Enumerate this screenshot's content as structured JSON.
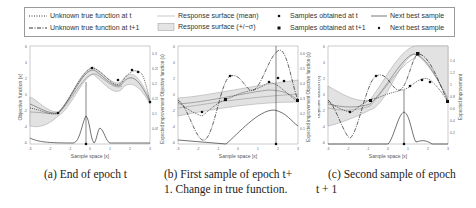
{
  "legend": {
    "items": [
      {
        "label": "Unknown true function at t",
        "icon": "dotted-line"
      },
      {
        "label": "Unknown true function at t+1",
        "icon": "dash-dot-line"
      },
      {
        "label": "Response surface (mean)",
        "icon": "thin-gray-line"
      },
      {
        "label": "Response surface (+/−σ)",
        "icon": "gray-filled-box"
      },
      {
        "label": "Samples obtained at t",
        "icon": "small-dot"
      },
      {
        "label": "Samples obtained at t+1",
        "icon": "black-square"
      },
      {
        "label": "Next best sample",
        "icon": "solid-line"
      },
      {
        "label": "Next best sample",
        "icon": "star-dot"
      }
    ]
  },
  "panels": [
    {
      "id": "a",
      "ylabel_left": "Objective function (x)",
      "ylabel_right": "Expected improvement",
      "xlabel": "Sample space [x]",
      "x_ticks": [
        "-3",
        "-2",
        "-1",
        "0",
        "1",
        "2",
        "3"
      ],
      "y_ticks_left": [
        "-6",
        "-4",
        "-2",
        "0",
        "2",
        "4",
        "6"
      ],
      "y_ticks_right": [
        "0",
        "0.05",
        "0.1",
        "0.15",
        "0.2",
        "0.25",
        "0.3"
      ],
      "caption": "(a) End of epoch t"
    },
    {
      "id": "b",
      "ylabel_left": "Expected improvement Objective function (x)",
      "ylabel_right": "Expected improvement Objective function (x)",
      "xlabel": "Sample space [x]",
      "x_ticks": [
        "-3",
        "-2",
        "-1",
        "0",
        "1",
        "2",
        "3"
      ],
      "y_ticks_left": [
        "-6",
        "-4",
        "-2",
        "0",
        "2",
        "4",
        "6"
      ],
      "y_ticks_right": [
        "0",
        "0.1",
        "0.2",
        "0.3",
        "0.4",
        "0.5",
        "0.6"
      ],
      "caption_line1": "(b) First sample of epoch t+",
      "caption_line2": "1. Change in true function."
    },
    {
      "id": "c",
      "ylabel_left": "Objective function (x)",
      "ylabel_right": "Expected improvement",
      "xlabel": "Sample space [x]",
      "x_ticks": [
        "-3",
        "-2",
        "-1",
        "0",
        "1",
        "2",
        "3"
      ],
      "y_ticks_left": [
        "-6",
        "-4",
        "-2",
        "0",
        "2",
        "4",
        "6"
      ],
      "y_ticks_right": [
        "0",
        "0.2",
        "0.4",
        "0.6",
        "0.8",
        "1",
        "1.2",
        "1.4"
      ],
      "caption_line1": "(c) Second sample of epoch",
      "caption_line2": "t + 1"
    }
  ]
}
